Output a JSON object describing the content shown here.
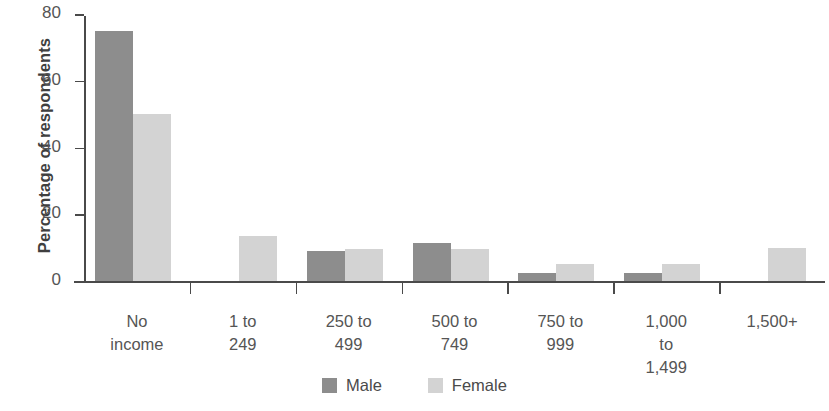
{
  "chart_data": {
    "type": "bar",
    "title": "",
    "subtitle": "",
    "xlabel": "",
    "ylabel": "Percentage of respondents",
    "ylim": [
      0,
      80
    ],
    "yticks": [
      0,
      20,
      40,
      60,
      80
    ],
    "ytick_labels": [
      "0",
      "20",
      "40",
      "60",
      "80"
    ],
    "grid": false,
    "legend_position": "bottom-center",
    "categories": [
      "No income",
      "1 to 249",
      "250 to 499",
      "500 to 749",
      "750 to 999",
      "1,000 to 1,499",
      "1,500+"
    ],
    "category_label_lines": [
      [
        "No",
        "income"
      ],
      [
        "1 to",
        "249"
      ],
      [
        "250 to",
        "499"
      ],
      [
        "500 to",
        "749"
      ],
      [
        "750 to",
        "999"
      ],
      [
        "1,000",
        "to",
        "1,499"
      ],
      [
        "1,500+"
      ]
    ],
    "series": [
      {
        "name": "Male",
        "color": "#8d8d8d",
        "values": [
          75,
          0,
          9,
          11.5,
          2.5,
          2.5,
          0
        ]
      },
      {
        "name": "Female",
        "color": "#d3d3d3",
        "values": [
          50,
          13.5,
          9.5,
          9.5,
          5,
          5,
          10
        ]
      }
    ]
  },
  "legend": {
    "items": [
      {
        "label": "Male",
        "color": "#8d8d8d"
      },
      {
        "label": "Female",
        "color": "#d3d3d3"
      }
    ]
  },
  "colors": {
    "male": "#8d8d8d",
    "female": "#d3d3d3",
    "axis": "#4a4a4a",
    "text": "#555555",
    "background": "#ffffff"
  }
}
